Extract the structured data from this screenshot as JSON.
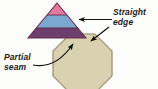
{
  "figure": {
    "background_color": "#fdfdfb",
    "width": 158,
    "height": 89
  },
  "labels": {
    "straight_edge": "Straight\nedge",
    "partial_seam": "Partial\nseam"
  },
  "shapes": {
    "triangle": {
      "name": "striped-triangle",
      "description": "Three-band triangular piece",
      "apex": [
        57,
        3
      ],
      "base_left": [
        28,
        38
      ],
      "base_right": [
        86,
        38
      ],
      "bands": [
        {
          "name": "top-band",
          "color": "#e2799f",
          "label": "pink"
        },
        {
          "name": "middle-band",
          "color": "#7aa8cf",
          "label": "light blue"
        },
        {
          "name": "bottom-band",
          "color": "#6e3f6e",
          "label": "purple"
        }
      ],
      "outline_color": "#6b2f4a"
    },
    "octagon": {
      "name": "tan-octagon",
      "description": "Octagonal patch piece",
      "fill_color": "#d8d2b0",
      "outline_color": "#8a8266",
      "center": [
        82,
        62
      ],
      "radius": 30
    }
  },
  "annotations": [
    {
      "name": "straight-edge-arrow",
      "type": "straight-arrow",
      "points_to": "triangle bottom edge",
      "color": "#111111"
    },
    {
      "name": "seam-point-arrow",
      "type": "straight-arrow",
      "points_to": "triangle-octagon junction",
      "color": "#111111"
    },
    {
      "name": "partial-seam-arrow",
      "type": "curved-arrow",
      "points_to": "partial seam at triangle base",
      "color": "#111111"
    }
  ]
}
